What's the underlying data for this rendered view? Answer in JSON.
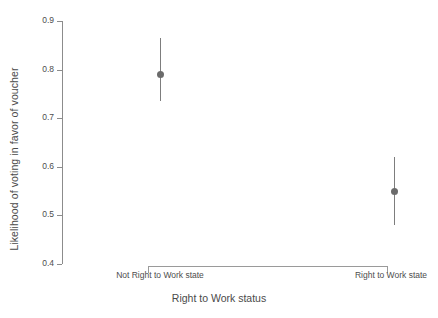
{
  "chart_data": {
    "type": "scatter",
    "title": "",
    "xlabel": "Right to Work status",
    "ylabel": "Likelihood of voting in favor of voucher",
    "categories": [
      "Not Right to Work state",
      "Right to Work state"
    ],
    "values": [
      0.79,
      0.55
    ],
    "error_low": [
      0.735,
      0.48
    ],
    "error_high": [
      0.865,
      0.62
    ],
    "series": [
      {
        "name": "Predicted likelihood",
        "points": [
          {
            "category": "Not Right to Work state",
            "estimate": 0.79,
            "ci_low": 0.735,
            "ci_high": 0.865
          },
          {
            "category": "Right to Work state",
            "estimate": 0.55,
            "ci_low": 0.48,
            "ci_high": 0.62
          }
        ]
      }
    ],
    "ylim": [
      0.4,
      0.9
    ],
    "yticks": [
      0.4,
      0.5,
      0.6,
      0.7,
      0.8,
      0.9
    ],
    "ytick_labels": [
      "0.4",
      "0.5",
      "0.6",
      "0.7",
      "0.8",
      "0.9"
    ],
    "grid": false,
    "legend": false,
    "legend_position": "none",
    "point_color": "#6b6b6b",
    "error_bar_color": "#7d7d7d",
    "axis_color": "#8c8c8c",
    "background_color": "#ffffff",
    "text_color": "#4d4d4d"
  },
  "axes": {
    "y": {
      "title": "Likelihood of voting in favor of voucher",
      "ticks": [
        {
          "value": 0.9,
          "label": "0.9"
        },
        {
          "value": 0.8,
          "label": "0.8"
        },
        {
          "value": 0.7,
          "label": "0.7"
        },
        {
          "value": 0.6,
          "label": "0.6"
        },
        {
          "value": 0.5,
          "label": "0.5"
        },
        {
          "value": 0.4,
          "label": "0.4"
        }
      ]
    },
    "x": {
      "title": "Right to Work status",
      "ticks": [
        {
          "label": "Not Right to Work state"
        },
        {
          "label": "Right to Work state"
        }
      ]
    }
  }
}
